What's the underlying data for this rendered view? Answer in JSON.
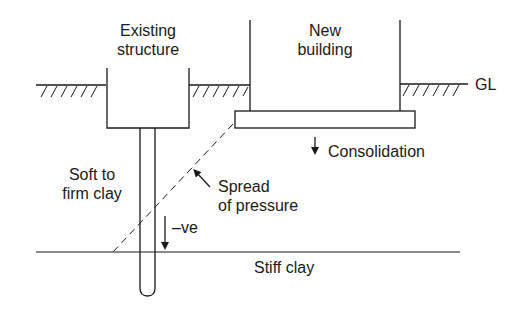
{
  "labels": {
    "existing_structure": [
      "Existing",
      "structure"
    ],
    "new_building": [
      "New",
      "building"
    ],
    "ground_level": "GL",
    "consolidation": "Consolidation",
    "soft_clay": [
      "Soft to",
      "firm clay"
    ],
    "spread_of_pressure": [
      "Spread",
      "of pressure"
    ],
    "negative_friction": "–ve",
    "stiff_clay": "Stiff clay"
  },
  "colors": {
    "line": "#1a1a1a",
    "background": "#ffffff"
  }
}
